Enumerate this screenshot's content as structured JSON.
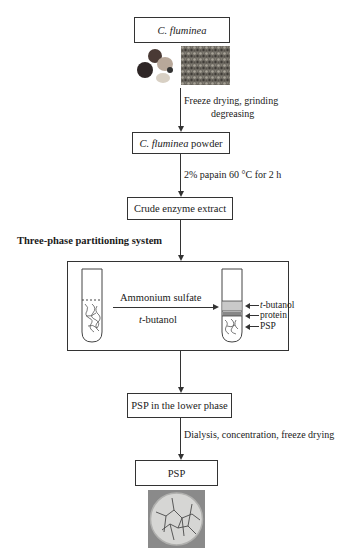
{
  "diagram": {
    "type": "flowchart",
    "nodes": [
      {
        "id": "source",
        "label_italic": "C. fluminea",
        "label_rest": ""
      },
      {
        "id": "powder",
        "label_italic": "C. fluminea",
        "label_rest": " powder"
      },
      {
        "id": "crude",
        "label": "Crude enzyme extract"
      },
      {
        "id": "tpp",
        "title": "Three-phase partitioning system"
      },
      {
        "id": "lower",
        "label": "PSP in the lower phase"
      },
      {
        "id": "psp",
        "label": "PSP"
      }
    ],
    "steps": [
      {
        "from": "source",
        "to": "powder",
        "line1": "Freeze drying, grinding",
        "line2": "degreasing"
      },
      {
        "from": "powder",
        "to": "crude",
        "text": "2% papain 60 °C for 2 h"
      },
      {
        "from": "crude",
        "to": "tpp"
      },
      {
        "from": "tpp",
        "to": "lower"
      },
      {
        "from": "lower",
        "to": "psp",
        "text": "Dialysis, concentration, freeze drying"
      }
    ],
    "tpp_panel": {
      "arrow_top": "Ammonium sulfate",
      "arrow_bottom_italic": "t",
      "arrow_bottom_rest": "-butanol",
      "layers": [
        {
          "italic": "t",
          "rest": "-butanol"
        },
        {
          "italic": "",
          "rest": "protein"
        },
        {
          "italic": "",
          "rest": "PSP"
        }
      ]
    },
    "images": [
      {
        "name": "clam-photo",
        "description": "C. fluminea clams"
      },
      {
        "name": "powder-photo",
        "description": "ground clam tissue"
      },
      {
        "name": "psp-photo",
        "description": "dried PSP in dish"
      }
    ]
  }
}
